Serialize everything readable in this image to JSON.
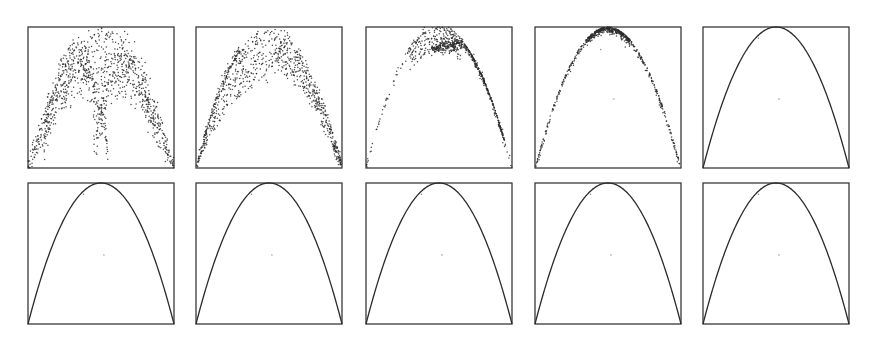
{
  "chart_data": {
    "type": "scatter",
    "title": "",
    "xlabel": "",
    "ylabel": "",
    "xlim": [
      0,
      1
    ],
    "ylim": [
      0,
      1
    ],
    "grid": false,
    "legend": "none",
    "curve": "y = 4x(1-x)",
    "colors": {
      "ink": "#2b2b2b",
      "frame": "#3a3a3a",
      "background": "#ffffff"
    },
    "panels": [
      {
        "index": 1,
        "row": 1,
        "col": 1,
        "state": "diffuse",
        "spread": 0.3,
        "points": 1100,
        "description": "broad cloud with double-arch structure"
      },
      {
        "index": 2,
        "row": 1,
        "col": 2,
        "state": "partially-converged",
        "spread": 0.18,
        "points": 900,
        "description": "cloud skewed to the right branch"
      },
      {
        "index": 3,
        "row": 1,
        "col": 3,
        "state": "concentrating",
        "spread": 0.1,
        "points": 800,
        "description": "dense band forming along right branch"
      },
      {
        "index": 4,
        "row": 1,
        "col": 4,
        "state": "near-converged",
        "spread": 0.02,
        "points": 700,
        "description": "points hugging the parabola, clustered near apex"
      },
      {
        "index": 5,
        "row": 1,
        "col": 5,
        "state": "converged",
        "spread": 0.0,
        "points": 600,
        "description": "clean parabola"
      },
      {
        "index": 6,
        "row": 2,
        "col": 1,
        "state": "converged",
        "spread": 0.0,
        "points": 600,
        "description": "clean parabola"
      },
      {
        "index": 7,
        "row": 2,
        "col": 2,
        "state": "converged",
        "spread": 0.0,
        "points": 600,
        "description": "clean parabola"
      },
      {
        "index": 8,
        "row": 2,
        "col": 3,
        "state": "converged",
        "spread": 0.0,
        "points": 600,
        "description": "clean parabola"
      },
      {
        "index": 9,
        "row": 2,
        "col": 4,
        "state": "converged",
        "spread": 0.0,
        "points": 600,
        "description": "clean parabola"
      },
      {
        "index": 10,
        "row": 2,
        "col": 5,
        "state": "converged",
        "spread": 0.0,
        "points": 600,
        "description": "clean parabola"
      }
    ]
  }
}
